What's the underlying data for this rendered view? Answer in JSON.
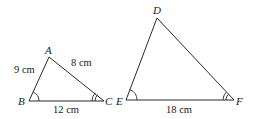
{
  "diagram": {
    "type": "similar-triangles",
    "triangles": [
      {
        "name": "ABC",
        "vertices": {
          "A": {
            "label": "A",
            "x": 49,
            "y": 57
          },
          "B": {
            "label": "B",
            "x": 29,
            "y": 101
          },
          "C": {
            "label": "C",
            "x": 104,
            "y": 101
          }
        },
        "sides": {
          "AB": {
            "label": "9 cm"
          },
          "AC": {
            "label": "8 cm"
          },
          "BC": {
            "label": "12 cm"
          }
        },
        "angle_marks": {
          "B": "single-arc",
          "C": "double-arc"
        }
      },
      {
        "name": "DEF",
        "vertices": {
          "D": {
            "label": "D",
            "x": 157,
            "y": 18
          },
          "E": {
            "label": "E",
            "x": 126,
            "y": 100
          },
          "F": {
            "label": "F",
            "x": 234,
            "y": 100
          }
        },
        "sides": {
          "EF": {
            "label": "18 cm"
          }
        },
        "angle_marks": {
          "E": "single-arc",
          "F": "double-arc"
        }
      }
    ],
    "colors": {
      "line": "#2a2a2a",
      "text": "#1a1a1a",
      "background": "#ffffff"
    }
  }
}
